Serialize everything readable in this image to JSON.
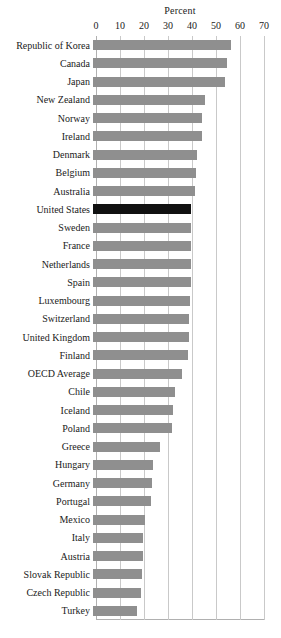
{
  "chart_data": {
    "type": "bar",
    "orientation": "horizontal",
    "title": "Percent",
    "xlabel": "Percent",
    "ylabel": "",
    "xlim": [
      0,
      70
    ],
    "xticks": [
      0,
      10,
      20,
      30,
      40,
      50,
      60,
      70
    ],
    "grid": true,
    "legend": false,
    "highlight_category": "United States",
    "colors": {
      "bar": "#8f8f8f",
      "highlight_bar": "#111111",
      "gridline": "#c9c9c9",
      "axis": "#b0b0b0",
      "text": "#1a1a1a",
      "background": "#ffffff"
    },
    "categories": [
      "Republic of Korea",
      "Canada",
      "Japan",
      "New Zealand",
      "Norway",
      "Ireland",
      "Denmark",
      "Belgium",
      "Australia",
      "United States",
      "Sweden",
      "France",
      "Netherlands",
      "Spain",
      "Luxembourg",
      "Switzerland",
      "United Kingdom",
      "Finland",
      "OECD Average",
      "Chile",
      "Iceland",
      "Poland",
      "Greece",
      "Hungary",
      "Germany",
      "Portugal",
      "Mexico",
      "Italy",
      "Austria",
      "Slovak Republic",
      "Czech Republic",
      "Turkey"
    ],
    "values": [
      57.5,
      56.0,
      55.0,
      46.5,
      45.5,
      45.5,
      43.5,
      43.0,
      42.5,
      41.0,
      41.0,
      41.0,
      41.0,
      41.0,
      40.5,
      40.0,
      40.0,
      39.5,
      37.0,
      34.0,
      33.5,
      33.0,
      28.0,
      25.0,
      24.5,
      24.0,
      21.5,
      21.0,
      21.0,
      20.5,
      20.0,
      18.5
    ]
  }
}
